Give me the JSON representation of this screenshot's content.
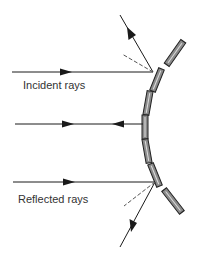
{
  "diagram": {
    "labels": {
      "incident": "Incident rays",
      "reflected": "Reflected rays"
    },
    "colors": {
      "ray": "#1a1a1a",
      "mirror_fill": "#8a8a8a",
      "mirror_stroke": "#222222",
      "normal_dash": "#555555",
      "text": "#333333"
    }
  }
}
